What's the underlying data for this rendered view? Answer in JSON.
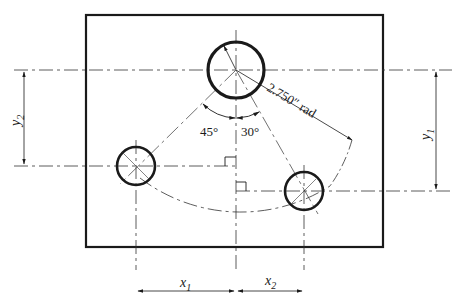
{
  "diagram": {
    "type": "engineering-drawing",
    "colors": {
      "line": "#1a1a1a",
      "background": "#ffffff"
    },
    "labels": {
      "radius": "2.750″ rad",
      "angle_left": "45°",
      "angle_right": "30°",
      "x1": "x",
      "x1_sub": "1",
      "x2": "x",
      "x2_sub": "2",
      "y1": "y",
      "y1_sub": "1",
      "y2": "y",
      "y2_sub": "2"
    },
    "holes": [
      {
        "name": "top-hole",
        "cx": 236,
        "cy": 70,
        "r": 28
      },
      {
        "name": "left-hole",
        "cx": 136,
        "cy": 166,
        "r": 19
      },
      {
        "name": "right-hole",
        "cx": 304,
        "cy": 191,
        "r": 19
      }
    ],
    "plate": {
      "x": 86,
      "y": 15,
      "width": 297,
      "height": 232
    }
  }
}
